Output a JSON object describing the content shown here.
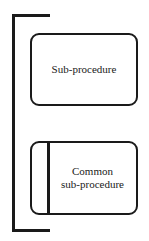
{
  "diagram": {
    "nodes": [
      {
        "id": "sub-procedure",
        "label": "Sub-procedure",
        "shape": "rounded-rectangle"
      },
      {
        "id": "common-sub-procedure",
        "label_lines": [
          "Common",
          "sub-procedure"
        ],
        "shape": "rounded-rectangle-with-left-bar"
      }
    ],
    "grouping": {
      "type": "left-bracket",
      "encloses": [
        "sub-procedure",
        "common-sub-procedure"
      ]
    },
    "colors": {
      "stroke": "#1a1a1a",
      "background": "#ffffff"
    }
  }
}
